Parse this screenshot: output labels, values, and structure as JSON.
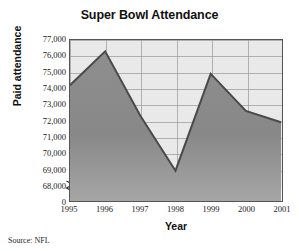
{
  "chart_data": {
    "type": "area",
    "title": "Super Bowl Attendance",
    "xlabel": "Year",
    "ylabel": "Paid attendance",
    "categories": [
      "1995",
      "1996",
      "1997",
      "1998",
      "1999",
      "2000",
      "2001"
    ],
    "values": [
      74200,
      76300,
      72300,
      68900,
      74900,
      72600,
      71900
    ],
    "series": [
      {
        "name": "Paid attendance",
        "values": [
          74200,
          76300,
          72300,
          68900,
          74900,
          72600,
          71900
        ]
      }
    ],
    "ylim": [
      68000,
      77000
    ],
    "y_ticks": [
      "77,000",
      "76,000",
      "75,000",
      "74,000",
      "73,000",
      "72,000",
      "71,000",
      "70,000",
      "69,000",
      "68,000",
      "0"
    ],
    "y_tick_values": [
      77000,
      76000,
      75000,
      74000,
      73000,
      72000,
      71000,
      70000,
      69000,
      68000,
      0
    ],
    "axis_break": true,
    "grid": true,
    "legend": "none",
    "source": "Source: NFL",
    "colors": {
      "fill_below": "#8a8a8a",
      "fill_above": "#e9e9e9",
      "line": "#4a4a4a",
      "grid": "#9c9c9c",
      "axis": "#555555",
      "text": "#1a1a1a"
    }
  },
  "figure": {
    "title": "Super Bowl Attendance",
    "y_axis_title": "Paid attendance",
    "x_axis_title": "Year",
    "source_note": "Source: NFL"
  }
}
